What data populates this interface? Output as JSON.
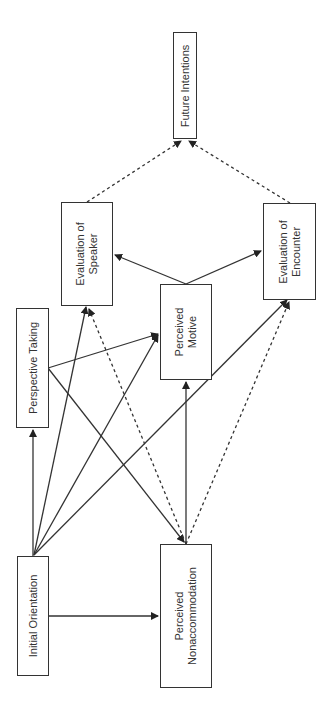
{
  "diagram": {
    "orientation": "rotated-90-ccw",
    "nodes": [
      {
        "id": "initial_orientation",
        "label": "Initial Orientation"
      },
      {
        "id": "perspective_taking",
        "label": "Perspective Taking"
      },
      {
        "id": "perceived_nonaccommodation",
        "label": "Perceived\nNonaccommodation",
        "line1": "Perceived",
        "line2": "Nonaccommodation"
      },
      {
        "id": "perceived_motive",
        "label": "Perceived\nMotive",
        "line1": "Perceived",
        "line2": "Motive"
      },
      {
        "id": "evaluation_of_speaker",
        "label": "Evaluation of\nSpeaker",
        "line1": "Evaluation of",
        "line2": "Speaker"
      },
      {
        "id": "evaluation_of_encounter",
        "label": "Evaluation of\nEncounter",
        "line1": "Evaluation of",
        "line2": "Encounter"
      },
      {
        "id": "future_intentions",
        "label": "Future Intentions"
      }
    ],
    "edges": [
      {
        "from": "initial_orientation",
        "to": "perspective_taking",
        "style": "solid"
      },
      {
        "from": "initial_orientation",
        "to": "perceived_nonaccommodation",
        "style": "solid"
      },
      {
        "from": "initial_orientation",
        "to": "evaluation_of_speaker",
        "style": "solid"
      },
      {
        "from": "initial_orientation",
        "to": "perceived_motive",
        "style": "solid"
      },
      {
        "from": "initial_orientation",
        "to": "evaluation_of_encounter",
        "style": "solid"
      },
      {
        "from": "perspective_taking",
        "to": "perceived_motive",
        "style": "solid"
      },
      {
        "from": "perspective_taking",
        "to": "perceived_nonaccommodation",
        "style": "solid"
      },
      {
        "from": "perceived_nonaccommodation",
        "to": "perceived_motive",
        "style": "solid"
      },
      {
        "from": "perceived_nonaccommodation",
        "to": "evaluation_of_speaker",
        "style": "dashed"
      },
      {
        "from": "perceived_nonaccommodation",
        "to": "evaluation_of_encounter",
        "style": "dashed"
      },
      {
        "from": "perceived_motive",
        "to": "evaluation_of_speaker",
        "style": "solid"
      },
      {
        "from": "perceived_motive",
        "to": "evaluation_of_encounter",
        "style": "solid"
      },
      {
        "from": "evaluation_of_speaker",
        "to": "future_intentions",
        "style": "dashed"
      },
      {
        "from": "evaluation_of_encounter",
        "to": "future_intentions",
        "style": "dashed"
      }
    ],
    "colors": {
      "line": "#333333",
      "background": "#ffffff"
    }
  }
}
